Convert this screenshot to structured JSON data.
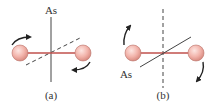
{
  "figure": {
    "panels": [
      {
        "id": "a",
        "caption": "(a)",
        "axis_label": "As",
        "axis_style": "solid",
        "reference_line_style": "dashed",
        "rotation": "axis vertical; rotation about vertical axis (arrows above-left pointing right, below-right pointing left)"
      },
      {
        "id": "b",
        "caption": "(b)",
        "axis_label": "As",
        "axis_style": "solid diagonal",
        "reference_line_style": "dashed vertical",
        "rotation": "axis diagonal; rotation shown by arrows at left going up and right going down"
      }
    ],
    "colors": {
      "rod": "#c0504d",
      "ball_fill": "#f2b8b0",
      "ball_stroke": "#b05a50",
      "line": "#333333",
      "text": "#333333"
    }
  }
}
